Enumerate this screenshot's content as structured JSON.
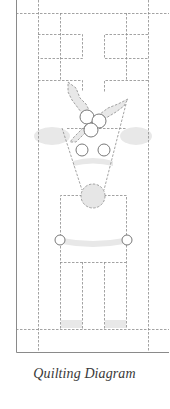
{
  "caption": "Quilting Diagram",
  "colors": {
    "frame": "#8a8a8a",
    "dashed": "#8c8c8c",
    "fill": "#e6e6e6",
    "circle_stroke": "#6a6a6a",
    "caption": "#3a3a3a"
  },
  "diagram": {
    "elements": [
      "frame",
      "quilting-grid",
      "holly-leaves",
      "berries",
      "ears",
      "head",
      "eyes",
      "mouth",
      "nose",
      "body",
      "buttons",
      "arms",
      "legs",
      "hooves"
    ]
  }
}
